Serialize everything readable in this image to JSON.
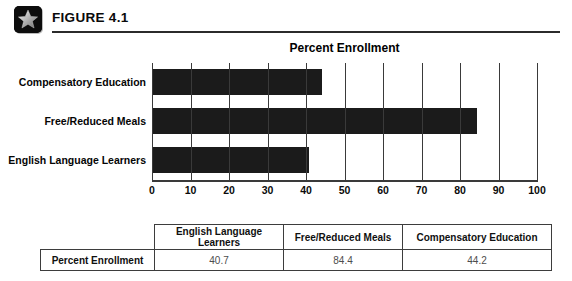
{
  "figure": {
    "label": "FIGURE 4.1",
    "icon": "star-icon"
  },
  "chart_data": {
    "type": "bar",
    "orientation": "horizontal",
    "title": "Percent Enrollment",
    "xlabel": "",
    "ylabel": "",
    "categories": [
      "English Language Learners",
      "Free/Reduced Meals",
      "Compensatory Education"
    ],
    "values": [
      40.7,
      84.4,
      44.2
    ],
    "series": [
      {
        "name": "Percent Enrollment",
        "values": [
          40.7,
          84.4,
          44.2
        ]
      }
    ],
    "xlim": [
      0,
      100
    ],
    "xticks": [
      0,
      10,
      20,
      30,
      40,
      50,
      60,
      70,
      80,
      90,
      100
    ],
    "xtick_labels": [
      "0",
      "10",
      "20",
      "30",
      "40",
      "50",
      "60",
      "70",
      "80",
      "90",
      "100"
    ],
    "grid": true,
    "grid_axis": "x",
    "legend": false,
    "bar_color": "#1b1b1b",
    "axis_color": "#3a3a3a",
    "background": "#ffffff"
  },
  "table": {
    "row_label": "Percent Enrollment",
    "headers": [
      "",
      "English Language Learners",
      "Free/Reduced Meals",
      "Compensatory Education"
    ],
    "rows": [
      {
        "label": "Percent Enrollment",
        "values": [
          "40.7",
          "84.4",
          "44.2"
        ]
      }
    ]
  }
}
